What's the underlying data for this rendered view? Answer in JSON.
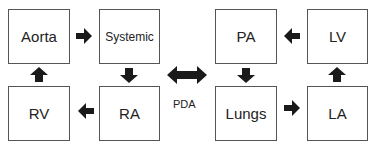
{
  "diagram": {
    "title": "",
    "nodes": [
      {
        "id": "aorta",
        "label": "Aorta"
      },
      {
        "id": "systemic",
        "label": "Systemic"
      },
      {
        "id": "rv",
        "label": "RV"
      },
      {
        "id": "ra",
        "label": "RA"
      },
      {
        "id": "pa",
        "label": "PA"
      },
      {
        "id": "lv",
        "label": "LV"
      },
      {
        "id": "lungs",
        "label": "Lungs"
      },
      {
        "id": "la",
        "label": "LA"
      }
    ],
    "edges": [
      {
        "from": "aorta",
        "to": "systemic"
      },
      {
        "from": "systemic",
        "to": "ra"
      },
      {
        "from": "ra",
        "to": "rv"
      },
      {
        "from": "rv",
        "to": "aorta"
      },
      {
        "from": "lv",
        "to": "pa"
      },
      {
        "from": "pa",
        "to": "lungs"
      },
      {
        "from": "lungs",
        "to": "la"
      },
      {
        "from": "la",
        "to": "lv"
      },
      {
        "from": "systemic-circuit",
        "to": "pulmonary-circuit",
        "bidirectional": true,
        "label": "PDA"
      }
    ],
    "connector_label": "PDA",
    "colors": {
      "box_border": "#555555",
      "arrow": "#1a1a1a",
      "text": "#222222"
    }
  }
}
